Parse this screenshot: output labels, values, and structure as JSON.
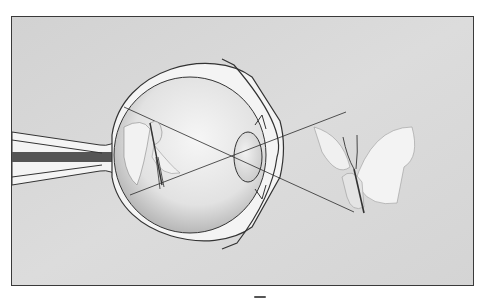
{
  "figure": {
    "elements": {
      "object": "butterfly (upright)",
      "image": "butterfly (inverted, on retina)",
      "structures": [
        "optic nerve",
        "sclera",
        "retina",
        "lens",
        "cornea",
        "iris",
        "ciliary body"
      ],
      "rays": 2
    },
    "colors": {
      "background": "#d8d8d8",
      "frame": "#3a3a3a",
      "eye_inner": "#ececec",
      "line": "#2a2a2a"
    }
  }
}
